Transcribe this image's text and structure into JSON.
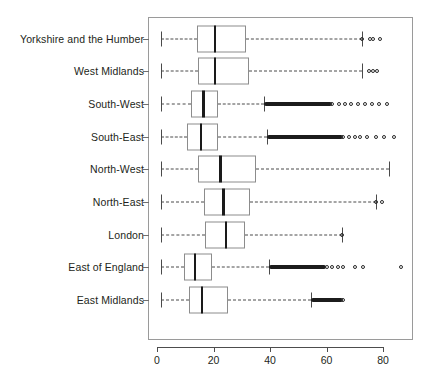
{
  "chart_data": {
    "type": "box",
    "title": "",
    "xlabel": "",
    "ylabel": "",
    "orientation": "horizontal",
    "xlim": [
      -2,
      92
    ],
    "xticks": [
      0,
      20,
      40,
      60,
      80
    ],
    "xticklabels": [
      "0",
      "20",
      "40",
      "60",
      "80"
    ],
    "grid": false,
    "legend": "none",
    "categories": [
      "Yorkshire and the Humber",
      "West Midlands",
      "South-West",
      "South-East",
      "North-West",
      "North-East",
      "London",
      "East of England",
      "East Midlands"
    ],
    "boxes": [
      {
        "category": "Yorkshire and the Humber",
        "whisker_low": 1.5,
        "q1": 14.0,
        "median": 20.5,
        "q3": 31.5,
        "whisker_high": 72.5,
        "outliers": [
          72.5,
          75.5,
          76.5,
          79.0
        ],
        "outlier_dense_ranges": []
      },
      {
        "category": "West Midlands",
        "whisker_low": 1.5,
        "q1": 14.5,
        "median": 20.5,
        "q3": 32.5,
        "whisker_high": 72.5,
        "outliers": [
          75.0,
          76.5,
          78.0
        ],
        "outlier_dense_ranges": []
      },
      {
        "category": "South-West",
        "whisker_low": 1.5,
        "q1": 12.0,
        "median": 16.5,
        "q3": 21.5,
        "whisker_high": 38.0,
        "outliers": [
          62.0,
          64.5,
          66.5,
          68.5,
          71.0,
          73.5,
          76.0,
          78.5,
          81.5
        ],
        "outlier_dense_ranges": [
          [
            38.0,
            62.0
          ]
        ]
      },
      {
        "category": "South-East",
        "whisker_low": 1.5,
        "q1": 10.5,
        "median": 15.5,
        "q3": 21.5,
        "whisker_high": 39.0,
        "outliers": [
          66.0,
          68.0,
          70.0,
          72.0,
          74.5,
          77.5,
          80.5,
          84.0
        ],
        "outlier_dense_ranges": [
          [
            39.0,
            66.0
          ]
        ]
      },
      {
        "category": "North-West",
        "whisker_low": 1.5,
        "q1": 14.5,
        "median": 22.5,
        "q3": 35.0,
        "whisker_high": 82.0,
        "outliers": [],
        "outlier_dense_ranges": []
      },
      {
        "category": "North-East",
        "whisker_low": 1.5,
        "q1": 16.5,
        "median": 23.5,
        "q3": 33.0,
        "whisker_high": 77.5,
        "outliers": [
          77.5,
          79.5
        ],
        "outlier_dense_ranges": []
      },
      {
        "category": "London",
        "whisker_low": 1.5,
        "q1": 17.0,
        "median": 24.5,
        "q3": 31.0,
        "whisker_high": 65.5,
        "outliers": [
          65.5
        ],
        "outlier_dense_ranges": []
      },
      {
        "category": "East of England",
        "whisker_low": 1.5,
        "q1": 9.5,
        "median": 13.5,
        "q3": 19.5,
        "whisker_high": 39.5,
        "outliers": [
          60.0,
          62.0,
          64.0,
          66.0,
          70.0,
          73.0,
          86.5
        ],
        "outlier_dense_ranges": [
          [
            39.5,
            60.0
          ]
        ]
      },
      {
        "category": "East Midlands",
        "whisker_low": 1.5,
        "q1": 11.5,
        "median": 16.0,
        "q3": 25.0,
        "whisker_high": 54.5,
        "outliers": [
          66.0
        ],
        "outlier_dense_ranges": [
          [
            54.5,
            66.0
          ]
        ]
      }
    ]
  },
  "style": {
    "box_border_color": "#8c8c8c",
    "median_color": "#1a1a1a",
    "whisker_color": "#4a4a4a",
    "frame_color": "#9a9a9a",
    "text_color": "#231f20",
    "background": "#ffffff"
  }
}
